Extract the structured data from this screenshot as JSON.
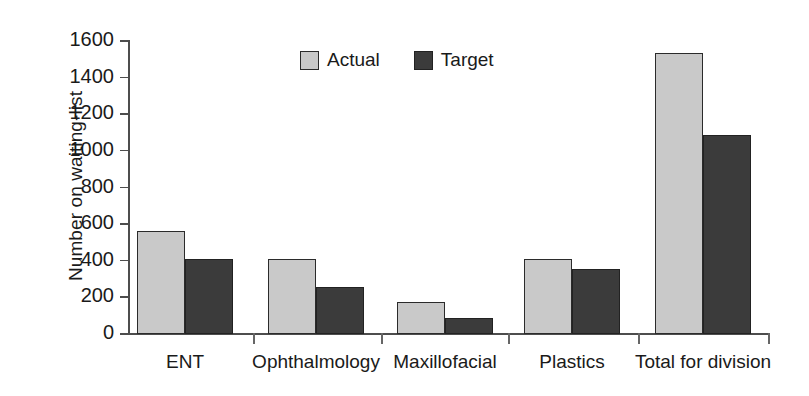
{
  "chart_data": {
    "type": "bar",
    "title": "",
    "subtitle": "",
    "xlabel": "",
    "ylabel": "Number on waiting-list",
    "ylim": [
      0,
      1600
    ],
    "ytick_step": 200,
    "yticks": [
      0,
      200,
      400,
      600,
      800,
      1000,
      1200,
      1400,
      1600
    ],
    "ytick_labels": [
      "0",
      "200",
      "400",
      "600",
      "800",
      "1000",
      "1200",
      "1400",
      "1600"
    ],
    "grid": false,
    "legend_position": "top-center",
    "categories": [
      "ENT",
      "Ophthalmology",
      "Maxillofacial",
      "Plastics",
      "Total for division"
    ],
    "series": [
      {
        "name": "Actual",
        "color": "#c9c9c9",
        "values": [
          560,
          410,
          175,
          410,
          1535
        ]
      },
      {
        "name": "Target",
        "color": "#3b3b3b",
        "values": [
          410,
          255,
          90,
          355,
          1085
        ]
      }
    ],
    "annotations": []
  },
  "legend": {
    "items": [
      {
        "label": "Actual",
        "swatch": "legend-swatch-actual"
      },
      {
        "label": "Target",
        "swatch": "legend-swatch-target"
      }
    ]
  },
  "colors": {
    "actual": "#c9c9c9",
    "target": "#3b3b3b",
    "axis": "#4d4d4d",
    "text": "#1a1a1a",
    "background": "#ffffff"
  }
}
